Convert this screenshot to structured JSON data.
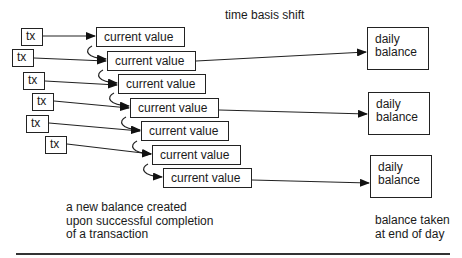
{
  "title": "time basis shift",
  "transactions": [
    {
      "label": "tx"
    },
    {
      "label": "tx"
    },
    {
      "label": "tx"
    },
    {
      "label": "tx"
    },
    {
      "label": "tx"
    },
    {
      "label": "tx"
    }
  ],
  "current_values": [
    {
      "label": "current value"
    },
    {
      "label": "current value"
    },
    {
      "label": "current value"
    },
    {
      "label": "current value"
    },
    {
      "label": "current value"
    },
    {
      "label": "current value"
    },
    {
      "label": "current value"
    }
  ],
  "daily_balances": [
    {
      "line1": "daily",
      "line2": "balance"
    },
    {
      "line1": "daily",
      "line2": "balance"
    },
    {
      "line1": "daily",
      "line2": "balance"
    }
  ],
  "captions": {
    "left": [
      "a new balance created",
      "upon successful completion",
      "of a transaction"
    ],
    "right": [
      "balance taken",
      "at end of day"
    ]
  },
  "colors": {
    "stroke": "#222222",
    "background": "#ffffff"
  }
}
